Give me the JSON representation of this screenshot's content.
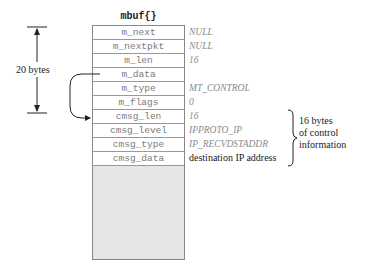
{
  "diagram": {
    "struct_title": "mbuf{}",
    "rows": [
      {
        "field": "m_next",
        "value": "NULL",
        "style": "italic"
      },
      {
        "field": "m_nextpkt",
        "value": "NULL",
        "style": "italic"
      },
      {
        "field": "m_len",
        "value": "16",
        "style": "italic"
      },
      {
        "field": "m_data",
        "value": "",
        "style": "italic"
      },
      {
        "field": "m_type",
        "value": "MT_CONTROL",
        "style": "italic"
      },
      {
        "field": "m_flags",
        "value": "0",
        "style": "italic"
      },
      {
        "field": "cmsg_len",
        "value": "16",
        "style": "italic"
      },
      {
        "field": "cmsg_level",
        "value": "IPPROTO_IP",
        "style": "italic"
      },
      {
        "field": "cmsg_type",
        "value": "IP_RECVDSTADDR",
        "style": "italic"
      },
      {
        "field": "cmsg_data",
        "value": "destination IP address",
        "style": "plain"
      }
    ],
    "header_size_label": "20 bytes",
    "control_info_label": [
      "16 bytes",
      "of control",
      "information"
    ],
    "colors": {
      "border": "#888888",
      "field_text": "#7a7a7a",
      "value_text": "#8a8a8a",
      "unused_area": "#e6e6e6",
      "line": "#222222"
    }
  }
}
